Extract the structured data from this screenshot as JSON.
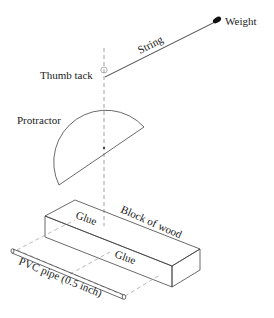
{
  "diagram": {
    "labels": {
      "weight": "Weight",
      "string": "String",
      "thumb_tack": "Thumb tack",
      "protractor": "Protractor",
      "glue_top": "Glue",
      "block": "Block of wood",
      "glue_side": "Glue",
      "pipe": "PVC pipe (0.5 inch)"
    },
    "colors": {
      "line": "#333333",
      "dash": "#888888",
      "weight_fill": "#111111"
    }
  }
}
